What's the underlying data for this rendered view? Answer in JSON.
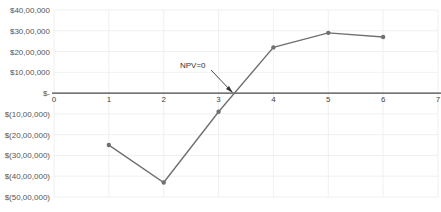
{
  "chart_data": {
    "type": "line",
    "title": "",
    "xlabel": "",
    "ylabel": "",
    "x": [
      1,
      2,
      3,
      4,
      5,
      6
    ],
    "series": [
      {
        "name": "NPV",
        "values": [
          -2500000,
          -4300000,
          -900000,
          2200000,
          2900000,
          2700000
        ],
        "color": "#707070"
      }
    ],
    "xlim": [
      0,
      7
    ],
    "ylim": [
      -5000000,
      4000000
    ],
    "x_ticks": [
      "0",
      "1",
      "2",
      "3",
      "4",
      "5",
      "6",
      "7"
    ],
    "y_ticks": [
      {
        "value": 4000000,
        "label": "$40,00,000"
      },
      {
        "value": 3000000,
        "label": "$30,00,000"
      },
      {
        "value": 2000000,
        "label": "$20,00,000"
      },
      {
        "value": 1000000,
        "label": "$10,00,000"
      },
      {
        "value": 0,
        "label": "$-"
      },
      {
        "value": -1000000,
        "label": "$(10,00,000)"
      },
      {
        "value": -2000000,
        "label": "$(20,00,000)"
      },
      {
        "value": -3000000,
        "label": "$(30,00,000)"
      },
      {
        "value": -4000000,
        "label": "$(40,00,000)"
      },
      {
        "value": -5000000,
        "label": "$(50,00,000)"
      }
    ],
    "grid": true,
    "legend": "none",
    "annotations": [
      {
        "text": "NPV=0",
        "points_to_x": 3.2,
        "points_to_y": 0
      }
    ]
  }
}
